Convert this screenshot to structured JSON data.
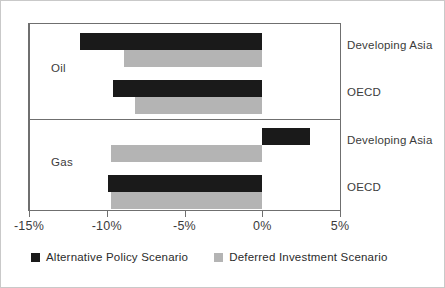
{
  "chart_data": {
    "type": "bar",
    "orientation": "horizontal",
    "title": "",
    "subtitle": "",
    "xlabel": "",
    "ylabel": "",
    "xlim": [
      -15,
      5
    ],
    "xticks": [
      -15,
      -10,
      -5,
      0,
      5
    ],
    "xticklabels": [
      "-15%",
      "-10%",
      "-5%",
      "0%",
      "5%"
    ],
    "grid": false,
    "zero_line": true,
    "legend_position": "bottom-left",
    "groups": [
      {
        "name": "Oil",
        "categories": [
          "Developing Asia",
          "OECD"
        ]
      },
      {
        "name": "Gas",
        "categories": [
          "Developing Asia",
          "OECD"
        ]
      }
    ],
    "categories": [
      "Oil - Developing Asia",
      "Oil - OECD",
      "Gas - Developing Asia",
      "Gas - OECD"
    ],
    "series": [
      {
        "name": "Alternative Policy Scenario",
        "color": "#1a1a1a",
        "values": [
          -11.7,
          -9.6,
          3.1,
          -9.9
        ]
      },
      {
        "name": "Deferred Investment Scenario",
        "color": "#b4b4b4",
        "values": [
          -8.9,
          -8.2,
          -9.7,
          -9.7
        ]
      }
    ]
  },
  "labels": {
    "group_oil": "Oil",
    "group_gas": "Gas",
    "oil_developing_asia": "Developing Asia",
    "oil_oecd": "OECD",
    "gas_developing_asia": "Developing Asia",
    "gas_oecd": "OECD"
  },
  "axis": {
    "tick_m15": "-15%",
    "tick_m10": "-10%",
    "tick_m5": "-5%",
    "tick_0": "0%",
    "tick_5": "5%"
  },
  "legend": {
    "items": [
      {
        "label": "Alternative Policy Scenario",
        "color": "#1a1a1a"
      },
      {
        "label": "Deferred Investment Scenario",
        "color": "#b4b4b4"
      }
    ]
  }
}
